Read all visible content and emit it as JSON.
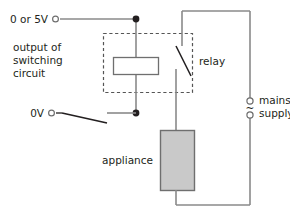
{
  "diagram": {
    "labels": {
      "supply_logic": "0 or 5V",
      "ground": "0V",
      "switching_circuit_line1": "output of",
      "switching_circuit_line2": "switching",
      "switching_circuit_line3": "circuit",
      "relay": "relay",
      "appliance": "appliance",
      "mains_line1": "mains",
      "mains_line2": "supply",
      "ac_symbol": "~"
    },
    "colors": {
      "wire": "#8a8a8a",
      "text": "#231f20",
      "appliance_fill": "#c9c9c9",
      "appliance_stroke": "#6f6f6f",
      "coil_fill": "#ffffff",
      "coil_stroke": "#6f6f6f",
      "dashed_box": "#555555",
      "node": "#231f20"
    },
    "components": [
      {
        "name": "relay-coil",
        "type": "coil"
      },
      {
        "name": "relay-contact",
        "type": "switch"
      },
      {
        "name": "manual-switch",
        "type": "switch"
      },
      {
        "name": "appliance",
        "type": "load"
      },
      {
        "name": "mains-supply",
        "type": "ac-source"
      }
    ]
  }
}
